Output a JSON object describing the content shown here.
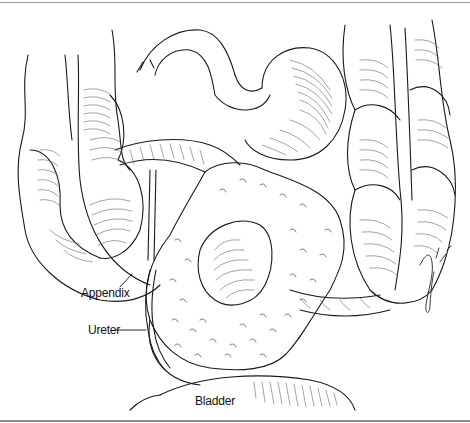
{
  "figure": {
    "labels": {
      "appendix": "Appendix",
      "ureter": "Ureter",
      "bladder": "Bladder"
    },
    "colors": {
      "ink": "#1a1a1a",
      "hatch": "#555555",
      "frame": "#9a9a9a",
      "background": "#ffffff"
    }
  }
}
